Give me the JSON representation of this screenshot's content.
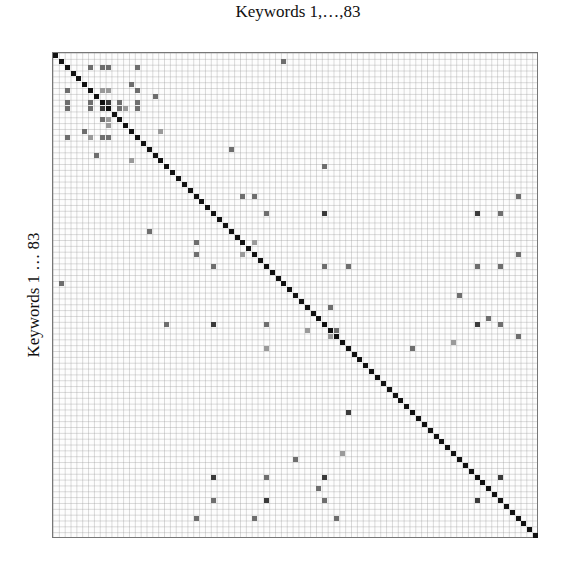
{
  "chart_data": {
    "type": "heatmap",
    "title": "Keywords 1,…,83",
    "xlabel": "Keywords 1,…,83",
    "ylabel": "Keywords 1 … 83",
    "size": 83,
    "diagonal": "all cells (i,i) filled black",
    "grid": true,
    "legend": null,
    "colors": {
      "diagonal": "#111111",
      "level1": "#9a9a9a",
      "level2": "#6e6e6e",
      "level3": "#3a3a3a",
      "background": "#fdfdfd"
    },
    "cells": [
      {
        "row": 1,
        "col": 39,
        "level": 2
      },
      {
        "row": 2,
        "col": 6,
        "level": 2
      },
      {
        "row": 2,
        "col": 8,
        "level": 2
      },
      {
        "row": 2,
        "col": 9,
        "level": 2
      },
      {
        "row": 2,
        "col": 14,
        "level": 2
      },
      {
        "row": 5,
        "col": 13,
        "level": 2
      },
      {
        "row": 6,
        "col": 2,
        "level": 2
      },
      {
        "row": 6,
        "col": 8,
        "level": 1
      },
      {
        "row": 6,
        "col": 9,
        "level": 1
      },
      {
        "row": 6,
        "col": 14,
        "level": 2
      },
      {
        "row": 7,
        "col": 17,
        "level": 2
      },
      {
        "row": 8,
        "col": 2,
        "level": 2
      },
      {
        "row": 9,
        "col": 2,
        "level": 2
      },
      {
        "row": 8,
        "col": 6,
        "level": 2
      },
      {
        "row": 9,
        "col": 6,
        "level": 2
      },
      {
        "row": 8,
        "col": 9,
        "level": 3
      },
      {
        "row": 9,
        "col": 8,
        "level": 3
      },
      {
        "row": 8,
        "col": 11,
        "level": 2
      },
      {
        "row": 9,
        "col": 11,
        "level": 2
      },
      {
        "row": 9,
        "col": 12,
        "level": 1
      },
      {
        "row": 8,
        "col": 14,
        "level": 2
      },
      {
        "row": 9,
        "col": 14,
        "level": 2
      },
      {
        "row": 11,
        "col": 8,
        "level": 2
      },
      {
        "row": 11,
        "col": 9,
        "level": 1
      },
      {
        "row": 12,
        "col": 9,
        "level": 1
      },
      {
        "row": 13,
        "col": 5,
        "level": 2
      },
      {
        "row": 13,
        "col": 18,
        "level": 1
      },
      {
        "row": 14,
        "col": 2,
        "level": 2
      },
      {
        "row": 14,
        "col": 6,
        "level": 1
      },
      {
        "row": 14,
        "col": 8,
        "level": 2
      },
      {
        "row": 14,
        "col": 9,
        "level": 2
      },
      {
        "row": 16,
        "col": 30,
        "level": 2
      },
      {
        "row": 17,
        "col": 7,
        "level": 2
      },
      {
        "row": 18,
        "col": 13,
        "level": 1
      },
      {
        "row": 19,
        "col": 46,
        "level": 2
      },
      {
        "row": 24,
        "col": 32,
        "level": 2
      },
      {
        "row": 24,
        "col": 34,
        "level": 2
      },
      {
        "row": 24,
        "col": 79,
        "level": 2
      },
      {
        "row": 27,
        "col": 36,
        "level": 2
      },
      {
        "row": 27,
        "col": 46,
        "level": 3
      },
      {
        "row": 27,
        "col": 72,
        "level": 3
      },
      {
        "row": 27,
        "col": 76,
        "level": 2
      },
      {
        "row": 30,
        "col": 16,
        "level": 2
      },
      {
        "row": 32,
        "col": 24,
        "level": 2
      },
      {
        "row": 32,
        "col": 34,
        "level": 1
      },
      {
        "row": 34,
        "col": 24,
        "level": 2
      },
      {
        "row": 34,
        "col": 32,
        "level": 1
      },
      {
        "row": 34,
        "col": 79,
        "level": 2
      },
      {
        "row": 36,
        "col": 27,
        "level": 2
      },
      {
        "row": 36,
        "col": 46,
        "level": 2
      },
      {
        "row": 36,
        "col": 50,
        "level": 2
      },
      {
        "row": 36,
        "col": 72,
        "level": 2
      },
      {
        "row": 36,
        "col": 76,
        "level": 2
      },
      {
        "row": 39,
        "col": 1,
        "level": 2
      },
      {
        "row": 41,
        "col": 69,
        "level": 2
      },
      {
        "row": 43,
        "col": 47,
        "level": 2
      },
      {
        "row": 45,
        "col": 74,
        "level": 2
      },
      {
        "row": 46,
        "col": 19,
        "level": 2
      },
      {
        "row": 46,
        "col": 27,
        "level": 3
      },
      {
        "row": 46,
        "col": 36,
        "level": 2
      },
      {
        "row": 46,
        "col": 72,
        "level": 3
      },
      {
        "row": 46,
        "col": 76,
        "level": 2
      },
      {
        "row": 47,
        "col": 43,
        "level": 1
      },
      {
        "row": 47,
        "col": 48,
        "level": 2
      },
      {
        "row": 48,
        "col": 47,
        "level": 1
      },
      {
        "row": 48,
        "col": 79,
        "level": 2
      },
      {
        "row": 49,
        "col": 68,
        "level": 1
      },
      {
        "row": 50,
        "col": 36,
        "level": 1
      },
      {
        "row": 50,
        "col": 61,
        "level": 2
      },
      {
        "row": 61,
        "col": 50,
        "level": 3
      },
      {
        "row": 68,
        "col": 49,
        "level": 1
      },
      {
        "row": 69,
        "col": 41,
        "level": 2
      },
      {
        "row": 72,
        "col": 27,
        "level": 3
      },
      {
        "row": 72,
        "col": 36,
        "level": 2
      },
      {
        "row": 72,
        "col": 46,
        "level": 3
      },
      {
        "row": 72,
        "col": 76,
        "level": 3
      },
      {
        "row": 74,
        "col": 45,
        "level": 2
      },
      {
        "row": 76,
        "col": 27,
        "level": 2
      },
      {
        "row": 76,
        "col": 36,
        "level": 3
      },
      {
        "row": 76,
        "col": 46,
        "level": 2
      },
      {
        "row": 76,
        "col": 72,
        "level": 3
      },
      {
        "row": 79,
        "col": 24,
        "level": 2
      },
      {
        "row": 79,
        "col": 34,
        "level": 2
      },
      {
        "row": 79,
        "col": 48,
        "level": 2
      }
    ]
  }
}
